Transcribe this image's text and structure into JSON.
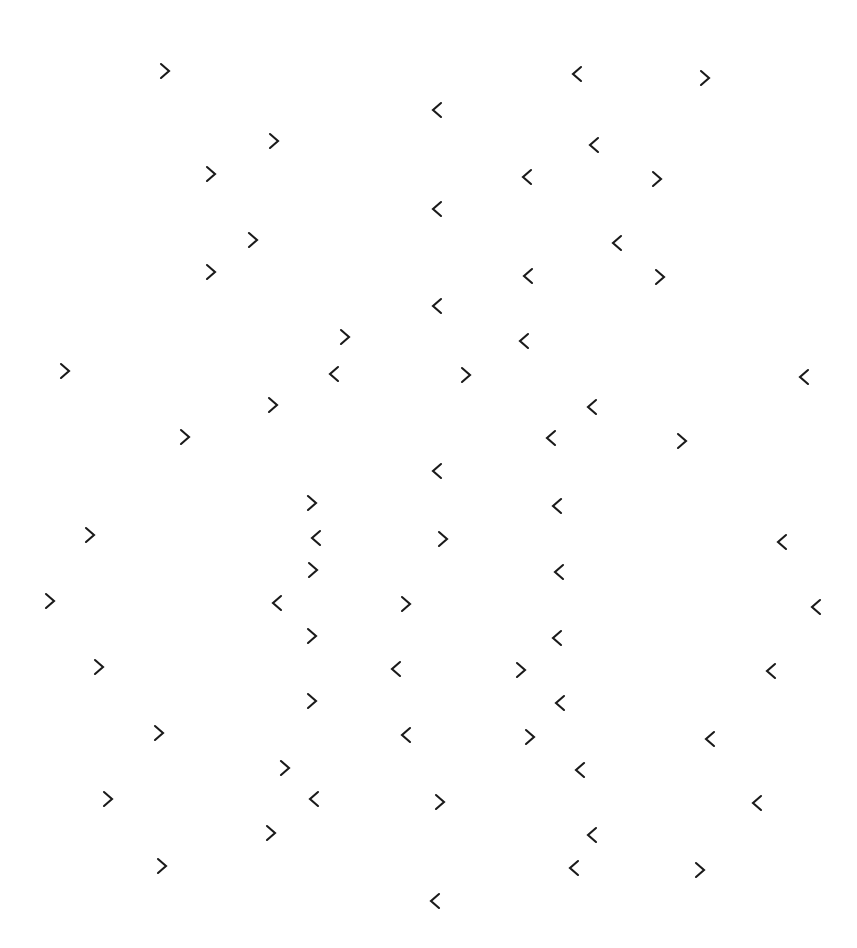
{
  "display": {
    "name": "visual-search-display",
    "width": 857,
    "height": 948,
    "background_color": "#ffffff",
    "glyph_color": "#1a1a1a",
    "glyph_size_px": 22,
    "description": "Scattered chevron stimulus array on a plain white field",
    "item_count": 72,
    "right_chevron_count": 37,
    "left_chevron_count": 35,
    "glyph_labels": {
      "right": ">",
      "left": "<"
    }
  },
  "items": [
    {
      "id": 1,
      "dir": "right",
      "char": ">",
      "x": 165,
      "y": 71
    },
    {
      "id": 2,
      "dir": "left",
      "char": "<",
      "x": 577,
      "y": 74
    },
    {
      "id": 3,
      "dir": "right",
      "char": ">",
      "x": 705,
      "y": 78
    },
    {
      "id": 4,
      "dir": "left",
      "char": "<",
      "x": 437,
      "y": 110
    },
    {
      "id": 5,
      "dir": "right",
      "char": ">",
      "x": 274,
      "y": 141
    },
    {
      "id": 6,
      "dir": "left",
      "char": "<",
      "x": 594,
      "y": 145
    },
    {
      "id": 7,
      "dir": "right",
      "char": ">",
      "x": 211,
      "y": 174
    },
    {
      "id": 8,
      "dir": "left",
      "char": "<",
      "x": 527,
      "y": 177
    },
    {
      "id": 9,
      "dir": "right",
      "char": ">",
      "x": 657,
      "y": 179
    },
    {
      "id": 10,
      "dir": "left",
      "char": "<",
      "x": 437,
      "y": 209
    },
    {
      "id": 11,
      "dir": "right",
      "char": ">",
      "x": 253,
      "y": 240
    },
    {
      "id": 12,
      "dir": "left",
      "char": "<",
      "x": 617,
      "y": 243
    },
    {
      "id": 13,
      "dir": "right",
      "char": ">",
      "x": 211,
      "y": 272
    },
    {
      "id": 14,
      "dir": "left",
      "char": "<",
      "x": 528,
      "y": 276
    },
    {
      "id": 15,
      "dir": "right",
      "char": ">",
      "x": 660,
      "y": 277
    },
    {
      "id": 16,
      "dir": "left",
      "char": "<",
      "x": 437,
      "y": 306
    },
    {
      "id": 17,
      "dir": "right",
      "char": ">",
      "x": 345,
      "y": 337
    },
    {
      "id": 18,
      "dir": "left",
      "char": "<",
      "x": 524,
      "y": 341
    },
    {
      "id": 19,
      "dir": "right",
      "char": ">",
      "x": 65,
      "y": 371
    },
    {
      "id": 20,
      "dir": "left",
      "char": "<",
      "x": 334,
      "y": 374
    },
    {
      "id": 21,
      "dir": "right",
      "char": ">",
      "x": 466,
      "y": 375
    },
    {
      "id": 22,
      "dir": "left",
      "char": "<",
      "x": 804,
      "y": 377
    },
    {
      "id": 23,
      "dir": "right",
      "char": ">",
      "x": 273,
      "y": 405
    },
    {
      "id": 24,
      "dir": "left",
      "char": "<",
      "x": 592,
      "y": 407
    },
    {
      "id": 25,
      "dir": "right",
      "char": ">",
      "x": 185,
      "y": 437
    },
    {
      "id": 26,
      "dir": "left",
      "char": "<",
      "x": 551,
      "y": 438
    },
    {
      "id": 27,
      "dir": "right",
      "char": ">",
      "x": 682,
      "y": 441
    },
    {
      "id": 28,
      "dir": "left",
      "char": "<",
      "x": 437,
      "y": 471
    },
    {
      "id": 29,
      "dir": "right",
      "char": ">",
      "x": 312,
      "y": 503
    },
    {
      "id": 30,
      "dir": "left",
      "char": "<",
      "x": 557,
      "y": 506
    },
    {
      "id": 31,
      "dir": "right",
      "char": ">",
      "x": 90,
      "y": 535
    },
    {
      "id": 32,
      "dir": "left",
      "char": "<",
      "x": 316,
      "y": 538
    },
    {
      "id": 33,
      "dir": "right",
      "char": ">",
      "x": 443,
      "y": 539
    },
    {
      "id": 34,
      "dir": "left",
      "char": "<",
      "x": 782,
      "y": 542
    },
    {
      "id": 35,
      "dir": "right",
      "char": ">",
      "x": 313,
      "y": 570
    },
    {
      "id": 36,
      "dir": "left",
      "char": "<",
      "x": 559,
      "y": 572
    },
    {
      "id": 37,
      "dir": "right",
      "char": ">",
      "x": 50,
      "y": 601
    },
    {
      "id": 38,
      "dir": "left",
      "char": "<",
      "x": 277,
      "y": 603
    },
    {
      "id": 39,
      "dir": "right",
      "char": ">",
      "x": 406,
      "y": 604
    },
    {
      "id": 40,
      "dir": "left",
      "char": "<",
      "x": 816,
      "y": 607
    },
    {
      "id": 41,
      "dir": "right",
      "char": ">",
      "x": 312,
      "y": 636
    },
    {
      "id": 42,
      "dir": "left",
      "char": "<",
      "x": 557,
      "y": 638
    },
    {
      "id": 43,
      "dir": "right",
      "char": ">",
      "x": 99,
      "y": 667
    },
    {
      "id": 44,
      "dir": "left",
      "char": "<",
      "x": 396,
      "y": 669
    },
    {
      "id": 45,
      "dir": "right",
      "char": ">",
      "x": 521,
      "y": 670
    },
    {
      "id": 46,
      "dir": "left",
      "char": "<",
      "x": 771,
      "y": 671
    },
    {
      "id": 47,
      "dir": "right",
      "char": ">",
      "x": 312,
      "y": 701
    },
    {
      "id": 48,
      "dir": "left",
      "char": "<",
      "x": 560,
      "y": 703
    },
    {
      "id": 49,
      "dir": "right",
      "char": ">",
      "x": 159,
      "y": 733
    },
    {
      "id": 50,
      "dir": "left",
      "char": "<",
      "x": 406,
      "y": 735
    },
    {
      "id": 51,
      "dir": "right",
      "char": ">",
      "x": 530,
      "y": 737
    },
    {
      "id": 52,
      "dir": "left",
      "char": "<",
      "x": 710,
      "y": 739
    },
    {
      "id": 53,
      "dir": "right",
      "char": ">",
      "x": 285,
      "y": 768
    },
    {
      "id": 54,
      "dir": "left",
      "char": "<",
      "x": 580,
      "y": 770
    },
    {
      "id": 55,
      "dir": "right",
      "char": ">",
      "x": 108,
      "y": 799
    },
    {
      "id": 56,
      "dir": "left",
      "char": "<",
      "x": 314,
      "y": 799
    },
    {
      "id": 57,
      "dir": "right",
      "char": ">",
      "x": 440,
      "y": 802
    },
    {
      "id": 58,
      "dir": "left",
      "char": "<",
      "x": 757,
      "y": 803
    },
    {
      "id": 59,
      "dir": "right",
      "char": ">",
      "x": 271,
      "y": 833
    },
    {
      "id": 60,
      "dir": "left",
      "char": "<",
      "x": 592,
      "y": 835
    },
    {
      "id": 61,
      "dir": "right",
      "char": ">",
      "x": 162,
      "y": 866
    },
    {
      "id": 62,
      "dir": "left",
      "char": "<",
      "x": 574,
      "y": 868
    },
    {
      "id": 63,
      "dir": "right",
      "char": ">",
      "x": 700,
      "y": 870
    },
    {
      "id": 64,
      "dir": "left",
      "char": "<",
      "x": 435,
      "y": 901
    }
  ]
}
